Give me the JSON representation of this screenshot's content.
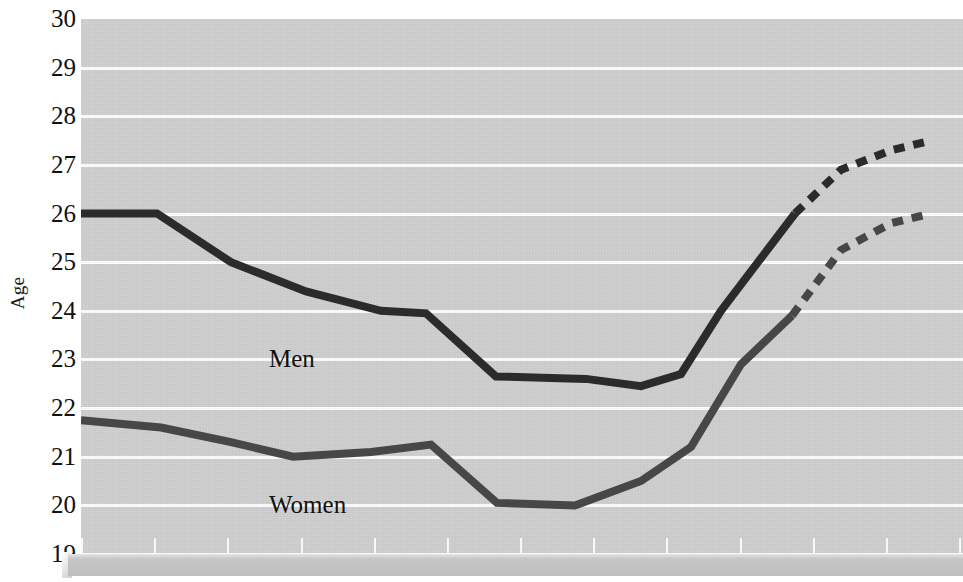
{
  "chart_data": {
    "type": "line",
    "title": "",
    "xlabel": "",
    "ylabel": "Age",
    "ylim": [
      19,
      30
    ],
    "y_ticks": [
      30,
      29,
      28,
      27,
      26,
      25,
      24,
      23,
      22,
      21,
      20,
      19
    ],
    "grid": true,
    "legend_position": "inline-annotation",
    "x_tick_count": 13,
    "x_tick_labels": [],
    "annotations": [
      {
        "text": "Men",
        "x_px": 188,
        "y_value": 23.0
      },
      {
        "text": "Women",
        "x_px": 188,
        "y_value": 20.0
      }
    ],
    "series": [
      {
        "name": "Men",
        "style": "solid-then-dashed",
        "color": "#2b2b2b",
        "solid_points": [
          {
            "x_px": 0,
            "y": 26.0
          },
          {
            "x_px": 76,
            "y": 26.0
          },
          {
            "x_px": 150,
            "y": 25.0
          },
          {
            "x_px": 225,
            "y": 24.4
          },
          {
            "x_px": 300,
            "y": 24.0
          },
          {
            "x_px": 345,
            "y": 23.95
          },
          {
            "x_px": 415,
            "y": 22.65
          },
          {
            "x_px": 505,
            "y": 22.6
          },
          {
            "x_px": 560,
            "y": 22.45
          },
          {
            "x_px": 600,
            "y": 22.7
          },
          {
            "x_px": 640,
            "y": 24.0
          },
          {
            "x_px": 714,
            "y": 26.0
          }
        ],
        "dashed_points": [
          {
            "x_px": 714,
            "y": 26.0
          },
          {
            "x_px": 760,
            "y": 26.9
          },
          {
            "x_px": 810,
            "y": 27.3
          },
          {
            "x_px": 850,
            "y": 27.5
          }
        ]
      },
      {
        "name": "Women",
        "style": "solid-then-dashed",
        "color": "#474747",
        "solid_points": [
          {
            "x_px": 0,
            "y": 21.75
          },
          {
            "x_px": 80,
            "y": 21.6
          },
          {
            "x_px": 150,
            "y": 21.3
          },
          {
            "x_px": 212,
            "y": 21.0
          },
          {
            "x_px": 290,
            "y": 21.1
          },
          {
            "x_px": 350,
            "y": 21.25
          },
          {
            "x_px": 416,
            "y": 20.05
          },
          {
            "x_px": 494,
            "y": 20.0
          },
          {
            "x_px": 560,
            "y": 20.5
          },
          {
            "x_px": 610,
            "y": 21.2
          },
          {
            "x_px": 660,
            "y": 22.9
          },
          {
            "x_px": 711,
            "y": 23.9
          }
        ],
        "dashed_points": [
          {
            "x_px": 711,
            "y": 23.9
          },
          {
            "x_px": 760,
            "y": 25.25
          },
          {
            "x_px": 810,
            "y": 25.8
          },
          {
            "x_px": 850,
            "y": 26.0
          }
        ]
      }
    ]
  },
  "axis": {
    "y_title": "Age",
    "y_tick_labels": [
      "30",
      "29",
      "28",
      "27",
      "26",
      "25",
      "24",
      "23",
      "22",
      "21",
      "20",
      "19"
    ]
  },
  "labels": {
    "men": "Men",
    "women": "Women"
  },
  "colors": {
    "plot_background": "#cfcfcf",
    "gridline": "#fdfdfd",
    "men_line": "#2b2b2b",
    "women_line": "#474747",
    "text": "#111111",
    "base_strip": "#c6c6c6"
  }
}
